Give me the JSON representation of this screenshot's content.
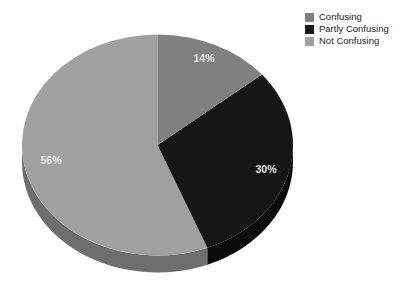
{
  "chart_data": {
    "type": "pie",
    "title": "",
    "subtitle": "",
    "xlabel": "",
    "ylabel": "",
    "three_d": true,
    "legend_position": "top-right",
    "grid": false,
    "categories": [
      "Confusing",
      "Partly Confusing",
      "Not Confusing"
    ],
    "values": [
      14,
      30,
      56
    ],
    "value_unit": "%",
    "data_labels": [
      "14%",
      "30%",
      "56%"
    ],
    "colors": [
      "#808080",
      "#161616",
      "#a0a0a0"
    ],
    "side_colors": [
      "#5f5f5f",
      "#0b0b0b",
      "#6e6e6e"
    ],
    "slices": [
      {
        "label": "Confusing",
        "value": 14,
        "data_label": "14%",
        "color": "#808080",
        "side_color": "#5f5f5f",
        "start_angle_deg": 0,
        "end_angle_deg": 50.4
      },
      {
        "label": "Partly Confusing",
        "value": 30,
        "data_label": "30%",
        "color": "#161616",
        "side_color": "#0b0b0b",
        "start_angle_deg": 50.4,
        "end_angle_deg": 158.4
      },
      {
        "label": "Not Confusing",
        "value": 56,
        "data_label": "56%",
        "color": "#a0a0a0",
        "side_color": "#6e6e6e",
        "start_angle_deg": 158.4,
        "end_angle_deg": 360
      }
    ]
  },
  "legend": {
    "items": [
      {
        "label": "Confusing",
        "color": "#808080"
      },
      {
        "label": "Partly Confusing",
        "color": "#161616"
      },
      {
        "label": "Not Confusing",
        "color": "#a0a0a0"
      }
    ]
  },
  "labels": {
    "confusing_pct": "14%",
    "partly_confusing_pct": "30%",
    "not_confusing_pct": "56%"
  },
  "canvas": {
    "background": "#ffffff",
    "width": 404,
    "height": 299
  }
}
